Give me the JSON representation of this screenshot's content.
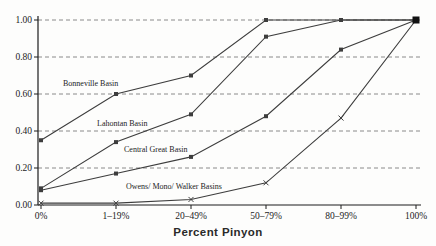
{
  "chart_data": {
    "type": "line",
    "title": "",
    "xlabel": "Percent Pinyon",
    "ylabel": "",
    "categories": [
      "0%",
      "1–19%",
      "20–49%",
      "50–79%",
      "80–99%",
      "100%"
    ],
    "y_ticks": [
      "0.00",
      "0.20",
      "0.40",
      "0.60",
      "0.80",
      "1.00"
    ],
    "ylim": [
      0,
      1
    ],
    "grid": "horizontal-dashed",
    "legend_position": "inline-labels",
    "series": [
      {
        "name": "Bonneville Basin",
        "values": [
          0.35,
          0.6,
          0.7,
          1.0,
          1.0,
          1.0
        ],
        "marker": "square",
        "label_pos": [
          63,
          86
        ]
      },
      {
        "name": "Lahontan Basin",
        "values": [
          0.09,
          0.34,
          0.49,
          0.91,
          1.0,
          1.0
        ],
        "marker": "square",
        "label_pos": [
          97,
          126
        ]
      },
      {
        "name": "Central Great Basin",
        "values": [
          0.08,
          0.17,
          0.26,
          0.48,
          0.84,
          1.0
        ],
        "marker": "square",
        "label_pos": [
          124,
          152
        ]
      },
      {
        "name": "Owens/ Mono/ Walker Basins",
        "values": [
          0.01,
          0.01,
          0.03,
          0.12,
          0.47,
          1.0
        ],
        "marker": "x",
        "label_pos": [
          126,
          189
        ]
      }
    ],
    "colors": {
      "line": "#3d3d3d",
      "axis": "#1c1c1c",
      "grid": "#8a8a8a",
      "text": "#1c1c1c",
      "final_point": "#111111"
    }
  }
}
